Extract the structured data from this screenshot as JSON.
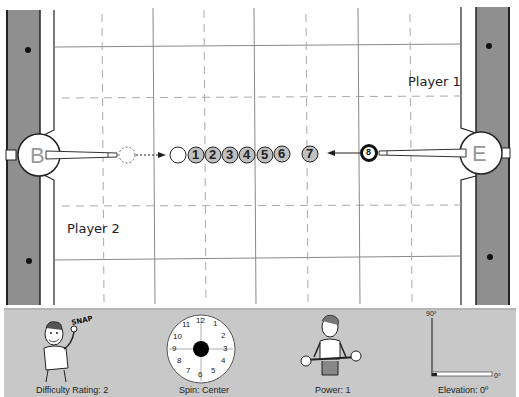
{
  "diagram": {
    "type": "pool-shot-diagram",
    "table": {
      "rail_color": "#8f8f8f",
      "felt_color": "#ffffff",
      "grid_color": "#999999",
      "diamonds": [
        "top-left",
        "bottom-left",
        "top-right",
        "bottom-right"
      ]
    },
    "players": {
      "player1": "Player 1",
      "player2": "Player 2"
    },
    "pockets": {
      "left": "B",
      "right": "E"
    },
    "cue_ball": {
      "label": "8",
      "position": "right"
    },
    "ghost_ball": {
      "label": "",
      "position": "left"
    },
    "object_balls": [
      "",
      "1",
      "2",
      "3",
      "4",
      "5",
      "6",
      "7"
    ],
    "ball_fill": "#c0c0c0"
  },
  "panel": {
    "difficulty": {
      "label": "Difficulty Rating: 2",
      "value": 2,
      "caption_art": "SNAP"
    },
    "spin": {
      "label": "Spin: Center",
      "value": "Center",
      "clock_numbers": [
        "12",
        "1",
        "2",
        "3",
        "4",
        "5",
        "6",
        "7",
        "8",
        "9",
        "10",
        "11"
      ]
    },
    "power": {
      "label": "Power: 1",
      "value": 1
    },
    "elevation": {
      "label": "Elevation: 0º",
      "value": "0º",
      "max_label": "90º",
      "min_label": "0º"
    }
  }
}
